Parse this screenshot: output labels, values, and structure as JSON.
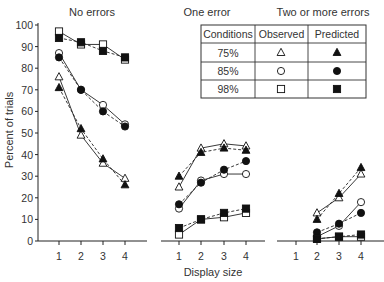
{
  "chart_data": {
    "type": "line",
    "ylabel": "Percent of trials",
    "xlabel": "Display size",
    "ylim": [
      0,
      100
    ],
    "yticks": [
      "0",
      "10",
      "20",
      "30",
      "40",
      "50",
      "60",
      "70",
      "80",
      "90",
      "100"
    ],
    "xticks": [
      "1",
      "2",
      "3",
      "4"
    ],
    "grid": false,
    "line_styles": {
      "observed": "solid",
      "predicted": "dashed"
    },
    "panels": [
      {
        "title": "No errors",
        "series": [
          {
            "name": "75% Observed",
            "marker": "open-triangle",
            "x": [
              1,
              2,
              3,
              4
            ],
            "values": [
              76,
              49,
              36,
              29
            ]
          },
          {
            "name": "75% Predicted",
            "marker": "filled-triangle",
            "x": [
              1,
              2,
              3,
              4
            ],
            "values": [
              71,
              52,
              38,
              26
            ]
          },
          {
            "name": "85% Observed",
            "marker": "open-circle",
            "x": [
              1,
              2,
              3,
              4
            ],
            "values": [
              87,
              70,
              63,
              54
            ]
          },
          {
            "name": "85% Predicted",
            "marker": "filled-circle",
            "x": [
              1,
              2,
              3,
              4
            ],
            "values": [
              85,
              70,
              60,
              53
            ]
          },
          {
            "name": "98% Observed",
            "marker": "open-square",
            "x": [
              1,
              2,
              3,
              4
            ],
            "values": [
              97,
              91,
              91,
              84
            ]
          },
          {
            "name": "98% Predicted",
            "marker": "filled-square",
            "x": [
              1,
              2,
              3,
              4
            ],
            "values": [
              94,
              92,
              88,
              85
            ]
          }
        ]
      },
      {
        "title": "One error",
        "series": [
          {
            "name": "75% Observed",
            "marker": "open-triangle",
            "x": [
              1,
              2,
              3,
              4
            ],
            "values": [
              25,
              43,
              45,
              44
            ]
          },
          {
            "name": "75% Predicted",
            "marker": "filled-triangle",
            "x": [
              1,
              2,
              3,
              4
            ],
            "values": [
              30,
              41,
              43,
              42
            ]
          },
          {
            "name": "85% Observed",
            "marker": "open-circle",
            "x": [
              1,
              2,
              3,
              4
            ],
            "values": [
              15,
              28,
              31,
              31
            ]
          },
          {
            "name": "85% Predicted",
            "marker": "filled-circle",
            "x": [
              1,
              2,
              3,
              4
            ],
            "values": [
              17,
              27,
              33,
              37
            ]
          },
          {
            "name": "98% Observed",
            "marker": "open-square",
            "x": [
              1,
              2,
              3,
              4
            ],
            "values": [
              3,
              10,
              11,
              13
            ]
          },
          {
            "name": "98% Predicted",
            "marker": "filled-square",
            "x": [
              1,
              2,
              3,
              4
            ],
            "values": [
              6,
              10,
              13,
              15
            ]
          }
        ]
      },
      {
        "title": "Two or more errors",
        "series": [
          {
            "name": "75% Observed",
            "marker": "open-triangle",
            "x": [
              2,
              3,
              4
            ],
            "values": [
              13,
              20,
              31
            ]
          },
          {
            "name": "75% Predicted",
            "marker": "filled-triangle",
            "x": [
              2,
              3,
              4
            ],
            "values": [
              10,
              22,
              34
            ]
          },
          {
            "name": "85% Observed",
            "marker": "open-circle",
            "x": [
              2,
              3,
              4
            ],
            "values": [
              2,
              7,
              18
            ]
          },
          {
            "name": "85% Predicted",
            "marker": "filled-circle",
            "x": [
              2,
              3,
              4
            ],
            "values": [
              4,
              8,
              13
            ]
          },
          {
            "name": "98% Observed",
            "marker": "open-square",
            "x": [
              2,
              3,
              4
            ],
            "values": [
              1,
              2,
              2
            ]
          },
          {
            "name": "98% Predicted",
            "marker": "filled-square",
            "x": [
              2,
              3,
              4
            ],
            "values": [
              1,
              2,
              3
            ]
          }
        ]
      }
    ],
    "legend": {
      "position": "upper-right table",
      "headers": [
        "Conditions",
        "Observed",
        "Predicted"
      ],
      "rows": [
        {
          "condition": "75%",
          "observed": "open-triangle",
          "predicted": "filled-triangle"
        },
        {
          "condition": "85%",
          "observed": "open-circle",
          "predicted": "filled-circle"
        },
        {
          "condition": "98%",
          "observed": "open-square",
          "predicted": "filled-square"
        }
      ]
    }
  }
}
